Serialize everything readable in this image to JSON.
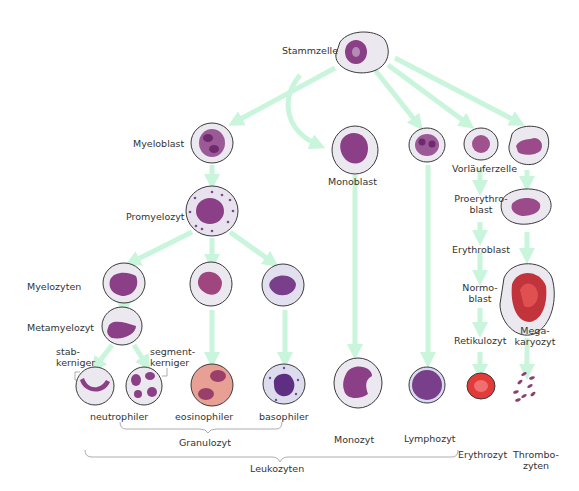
{
  "colors": {
    "arrow": "#c8f5dc",
    "cell_outline": "#3a3a3a",
    "cytoplasm": "#ece8f0",
    "nucleus": "#8a3f86",
    "eosinophil_cytoplasm": "#e8a095",
    "erythrocyte": "#e33a3a",
    "megakaryocyte_nucleus": "#c2343c",
    "bracket": "#999999"
  },
  "labels": {
    "stammzelle": "Stammzelle",
    "myeloblast": "Myeloblast",
    "monoblast": "Monoblast",
    "vorlaeuferzelle": "Vorläuferzelle",
    "promyelozyt": "Promyelozyt",
    "proerythroblast_1": "Proerythro-",
    "proerythroblast_2": "blast",
    "erythroblast": "Erythroblast",
    "myelozyten": "Myelozyten",
    "normoblast_1": "Normo-",
    "normoblast_2": "blast",
    "metamyelozyt": "Metamyelozyt",
    "stabkerniger_1": "stab-",
    "stabkerniger_2": "kerniger",
    "segmentkerniger_1": "segment-",
    "segmentkerniger_2": "kerniger",
    "retikulozyt": "Retikulozyt",
    "megakaryozyt_1": "Mega-",
    "megakaryozyt_2": "karyozyt",
    "neutrophiler": "neutrophiler",
    "eosinophiler": "eosinophiler",
    "basophiler": "basophiler",
    "granulozyt": "Granulozyt",
    "monozyt": "Monozyt",
    "lymphozyt": "Lymphozyt",
    "leukozyten": "Leukozyten",
    "erythrozyt": "Erythrozyt",
    "thrombozyten_1": "Thrombo-",
    "thrombozyten_2": "zyten"
  }
}
